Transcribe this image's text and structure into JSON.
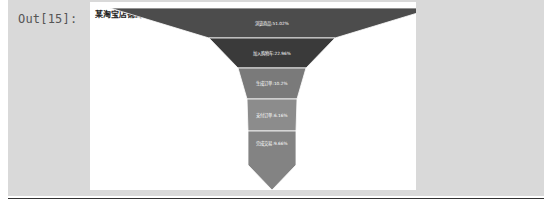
{
  "cell": {
    "prompt": "Out[15]:"
  },
  "chart_data": {
    "type": "funnel",
    "title": "某淘宝店铺的订单转化率漏斗图",
    "legend": {
      "position": "top-right",
      "entries": [
        {
          "name": "生成订单",
          "color": "#7a7a7a"
        },
        {
          "name": "加入购物车",
          "color": "#3a3a3a"
        },
        {
          "name": "浏览商品",
          "color": "#4c4c4c"
        },
        {
          "name": "支付订单",
          "color": "#8c8c8c"
        },
        {
          "name": "完成交易",
          "color": "#838383"
        }
      ]
    },
    "stages": [
      {
        "name": "浏览商品",
        "value": 51.02,
        "label": "浏览商品:51.02%",
        "color": "#4c4c4c"
      },
      {
        "name": "加入购物车",
        "value": 22.96,
        "label": "加入购物车:22.96%",
        "color": "#3a3a3a"
      },
      {
        "name": "生成订单",
        "value": 10.2,
        "label": "生成订单:10.2%",
        "color": "#7a7a7a"
      },
      {
        "name": "支付订单",
        "value": 6.16,
        "label": "支付订单:6.16%",
        "color": "#8c8c8c"
      },
      {
        "name": "完成交易",
        "value": 9.66,
        "label": "完成交易:9.66%",
        "color": "#838383"
      }
    ],
    "sort": "descending"
  }
}
